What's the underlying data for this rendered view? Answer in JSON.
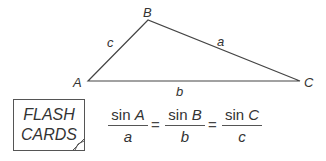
{
  "triangle": {
    "vertices": [
      {
        "label": "A",
        "x": 88,
        "y": 81
      },
      {
        "label": "B",
        "x": 148,
        "y": 20
      },
      {
        "label": "C",
        "x": 300,
        "y": 81
      }
    ],
    "sides": {
      "a": "a",
      "b": "b",
      "c": "c"
    },
    "line_color": "#444444"
  },
  "flash_cards": {
    "line1": "FLASH",
    "line2": "CARDS"
  },
  "formula": {
    "terms": [
      {
        "numerator_fn": "sin",
        "numerator_var": "A",
        "denominator": "a"
      },
      {
        "numerator_fn": "sin",
        "numerator_var": "B",
        "denominator": "b"
      },
      {
        "numerator_fn": "sin",
        "numerator_var": "C",
        "denominator": "c"
      }
    ],
    "equals": "="
  }
}
